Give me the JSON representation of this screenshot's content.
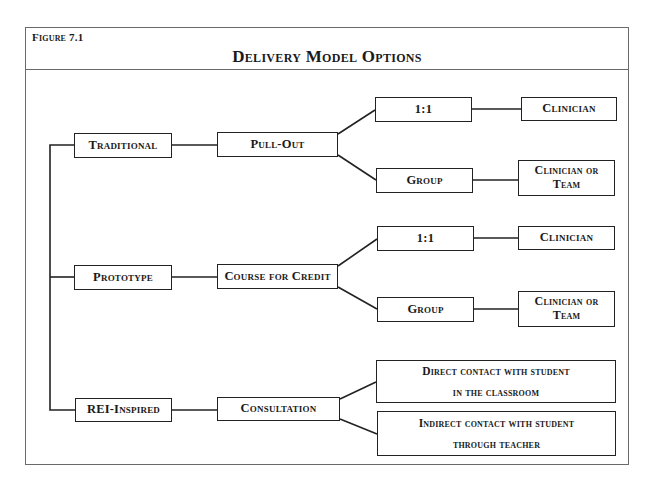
{
  "figure": {
    "label": "Figure 7.1",
    "title": "Delivery Model Options"
  },
  "tree": {
    "models": [
      {
        "name": "Traditional",
        "format": "Pull-Out",
        "options": [
          {
            "grouping": "1:1",
            "provider": "Clinician"
          },
          {
            "grouping": "Group",
            "provider_line1": "Clinician or",
            "provider_line2": "Team"
          }
        ]
      },
      {
        "name": "Prototype",
        "format": "Course for Credit",
        "options": [
          {
            "grouping": "1:1",
            "provider": "Clinician"
          },
          {
            "grouping": "Group",
            "provider_line1": "Clinician or",
            "provider_line2": "Team"
          }
        ]
      },
      {
        "name": "REI-Inspired",
        "format": "Consultation",
        "options": [
          {
            "line1": "Direct contact with student",
            "line2": "in the classroom"
          },
          {
            "line1": "Indirect contact with student",
            "line2": "through teacher"
          }
        ]
      }
    ]
  }
}
